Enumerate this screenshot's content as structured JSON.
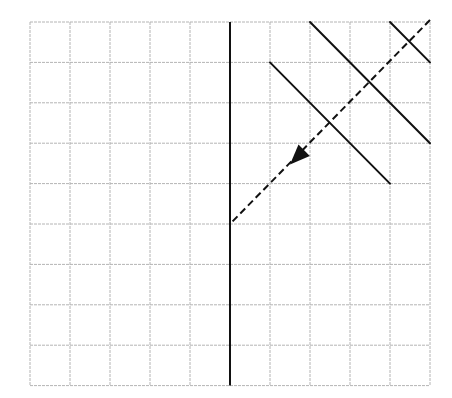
{
  "diagram": {
    "type": "grid-geometry",
    "colors": {
      "background": "#ffffff",
      "grid": "#b4b4b4",
      "ink": "#111111"
    },
    "grid": {
      "origin_px": [
        30,
        22
      ],
      "cols": 10,
      "rows": 9,
      "cell_w": 40,
      "cell_h": 40.4
    },
    "mirror_line": {
      "label": "thick vertical line",
      "col": 5,
      "from_row": 0,
      "to_row": 9
    },
    "segments": [
      {
        "name": "diagonal-short",
        "from": [
          9,
          0
        ],
        "to": [
          10,
          1
        ]
      },
      {
        "name": "diagonal-long",
        "from": [
          7,
          0
        ],
        "to": [
          10,
          3
        ]
      },
      {
        "name": "diagonal-mid",
        "from": [
          6,
          1
        ],
        "to": [
          9,
          4
        ]
      }
    ],
    "dashed_ray": {
      "from": [
        10,
        0
      ],
      "to": [
        5,
        5
      ],
      "arrow_at": [
        6.55,
        3.45
      ],
      "arrow_direction": "down-left"
    }
  }
}
